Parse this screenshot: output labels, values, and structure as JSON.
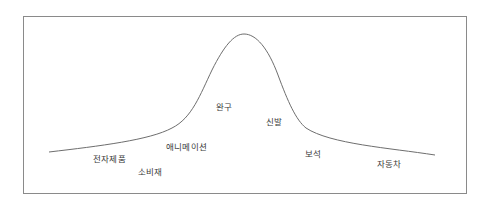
{
  "diagram": {
    "type": "bell-curve",
    "line_color": "#6e6e6e",
    "border_color": "#8a8a8a",
    "labels": [
      {
        "text": "전자제품",
        "x": 93,
        "y": 152
      },
      {
        "text": "소비재",
        "x": 138,
        "y": 165
      },
      {
        "text": "애니메이션",
        "x": 166,
        "y": 140
      },
      {
        "text": "완구",
        "x": 216,
        "y": 100
      },
      {
        "text": "신발",
        "x": 266,
        "y": 115
      },
      {
        "text": "보석",
        "x": 305,
        "y": 147
      },
      {
        "text": "자동차",
        "x": 377,
        "y": 157
      }
    ]
  }
}
